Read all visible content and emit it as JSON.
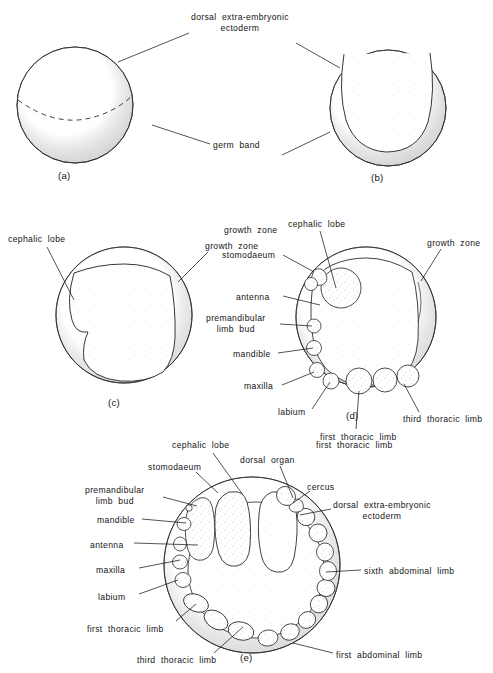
{
  "figure": {
    "panel_count": 5,
    "background_color": "#ffffff",
    "ink_color": "#1a1a1a"
  },
  "panels": [
    {
      "id": "(a)",
      "name": "panel-a",
      "center": [
        75,
        105
      ],
      "radius": 58,
      "labels": [
        {
          "name": "dorsal-extra-embryonic-ectoderm",
          "text_lines": [
            "dorsal  extra-embryonic",
            "ectoderm"
          ],
          "text": "dorsal extra-embryonic ectoderm",
          "x": 191,
          "y": 12,
          "align": "left",
          "leader": [
            [
              189,
              33
            ],
            [
              118,
              62
            ]
          ]
        },
        {
          "name": "germ-band",
          "text_lines": [
            "germ  band"
          ],
          "text": "germ band",
          "x": 213,
          "y": 140,
          "align": "left",
          "leader": [
            [
              210,
              144
            ],
            [
              152,
              125
            ]
          ]
        }
      ]
    },
    {
      "id": "(b)",
      "name": "panel-b",
      "center": [
        388,
        108
      ],
      "radius": 58,
      "labels": [
        {
          "name": "dorsal-extra-embryonic-ectoderm-leader-b",
          "text": "",
          "leader": [
            [
              296,
              43
            ],
            [
              340,
              68
            ]
          ]
        },
        {
          "name": "germ-band-leader-b",
          "text": "",
          "leader": [
            [
              282,
              155
            ],
            [
              330,
              132
            ]
          ]
        }
      ]
    },
    {
      "id": "(c)",
      "name": "panel-c",
      "center": [
        124,
        315
      ],
      "radius": 68,
      "labels": [
        {
          "name": "cephalic-lobe",
          "text_lines": [
            "cephalic  lobe"
          ],
          "text": "cephalic lobe",
          "x": 8,
          "y": 234,
          "align": "left",
          "leader": [
            [
              47,
              247
            ],
            [
              74,
              300
            ]
          ]
        },
        {
          "name": "growth-zone",
          "text_lines": [
            "growth  zone"
          ],
          "text": "growth zone",
          "x": 205,
          "y": 241,
          "align": "left",
          "leader": [
            [
              208,
              252
            ],
            [
              178,
              282
            ]
          ]
        }
      ]
    },
    {
      "id": "(d)",
      "name": "panel-d",
      "center": [
        366,
        317
      ],
      "radius": 70,
      "labels": [
        {
          "name": "cephalic-lobe",
          "text": "cephalic lobe",
          "text_lines": [
            "cephalic  lobe"
          ],
          "x": 288,
          "y": 219,
          "align": "left",
          "leader": [
            [
              320,
              231
            ],
            [
              336,
              288
            ]
          ]
        },
        {
          "name": "growth-zone",
          "text": "growth zone",
          "text_lines": [
            "growth  zone"
          ],
          "x": 427,
          "y": 238,
          "align": "left",
          "leader": [
            [
              441,
              249
            ],
            [
              421,
              281
            ]
          ]
        },
        {
          "name": "growth-zone-left",
          "text": "growth zone",
          "text_lines": [
            "growth  zone"
          ],
          "x": 224,
          "y": 225,
          "align": "left",
          "leader": null
        },
        {
          "name": "stomodaeum",
          "text": "stomodaeum",
          "text_lines": [
            "stomodaeum"
          ],
          "x": 222,
          "y": 250,
          "align": "left",
          "leader": [
            [
              283,
              255
            ],
            [
              314,
              272
            ]
          ]
        },
        {
          "name": "antenna",
          "text": "antenna",
          "text_lines": [
            "antenna"
          ],
          "x": 236,
          "y": 292,
          "align": "left",
          "leader": [
            [
              283,
              296
            ],
            [
              320,
              305
            ]
          ]
        },
        {
          "name": "premandibular-limb-bud",
          "text": "premandibular limb bud",
          "text_lines": [
            "premandibular",
            "limb  bud"
          ],
          "x": 206,
          "y": 313,
          "align": "left",
          "leader": [
            [
              280,
              324
            ],
            [
              312,
              326
            ]
          ]
        },
        {
          "name": "mandible",
          "text": "mandible",
          "text_lines": [
            "mandible"
          ],
          "x": 233,
          "y": 349,
          "align": "left",
          "leader": [
            [
              278,
              353
            ],
            [
              313,
              348
            ]
          ]
        },
        {
          "name": "maxilla",
          "text": "maxilla",
          "text_lines": [
            "maxilla"
          ],
          "x": 244,
          "y": 381,
          "align": "left",
          "leader": [
            [
              282,
              385
            ],
            [
              314,
              372
            ]
          ]
        },
        {
          "name": "labium",
          "text": "labium",
          "text_lines": [
            "labium"
          ],
          "x": 278,
          "y": 407,
          "align": "left",
          "leader": [
            [
              312,
              409
            ],
            [
              330,
              382
            ]
          ]
        },
        {
          "name": "third-thoracic-limb",
          "text": "third thoracic limb",
          "text_lines": [
            "third  thoracic  limb"
          ],
          "x": 403,
          "y": 414,
          "align": "left",
          "leader": [
            [
              419,
              412
            ],
            [
              404,
              384
            ]
          ]
        },
        {
          "name": "first-thoracic-limb",
          "text": "first thoracic limb",
          "text_lines": [
            "first  thoracic  limb"
          ],
          "x": 320,
          "y": 432,
          "align": "left",
          "leader": [
            [
              356,
              429
            ],
            [
              359,
              391
            ]
          ]
        }
      ]
    },
    {
      "id": "(e)",
      "name": "panel-e",
      "center": [
        252,
        565
      ],
      "radius": 88,
      "labels": [
        {
          "name": "cephalic-lobe",
          "text": "cephalic lobe",
          "text_lines": [
            "cephalic  lobe"
          ],
          "x": 172,
          "y": 440,
          "align": "left",
          "leader": [
            [
              213,
              453
            ],
            [
              243,
              495
            ]
          ]
        },
        {
          "name": "stomodaeum",
          "text": "stomodaeum",
          "text_lines": [
            "stomodaeum"
          ],
          "x": 148,
          "y": 462,
          "align": "left",
          "leader": [
            [
              196,
              472
            ],
            [
              218,
              493
            ]
          ]
        },
        {
          "name": "dorsal-organ",
          "text": "dorsal organ",
          "text_lines": [
            "dorsal  organ"
          ],
          "x": 240,
          "y": 455,
          "align": "left",
          "leader": [
            [
              280,
              466
            ],
            [
              293,
              498
            ]
          ]
        },
        {
          "name": "cercus",
          "text": "cercus",
          "text_lines": [
            "cercus"
          ],
          "x": 307,
          "y": 482,
          "align": "left",
          "leader": [
            [
              310,
              491
            ],
            [
              293,
              503
            ]
          ]
        },
        {
          "name": "premandibular-limb-bud",
          "text": "premandibular limb bud",
          "text_lines": [
            "premandibular",
            "limb  bud"
          ],
          "x": 85,
          "y": 485,
          "align": "left",
          "leader": [
            [
              163,
              497
            ],
            [
              197,
              506
            ]
          ]
        },
        {
          "name": "mandible",
          "text": "mandible",
          "text_lines": [
            "mandible"
          ],
          "x": 97,
          "y": 515,
          "align": "left",
          "leader": [
            [
              142,
              519
            ],
            [
              186,
              523
            ]
          ]
        },
        {
          "name": "antenna",
          "text": "antenna",
          "text_lines": [
            "antenna"
          ],
          "x": 90,
          "y": 540,
          "align": "left",
          "leader": [
            [
              134,
              543
            ],
            [
              198,
              545
            ]
          ]
        },
        {
          "name": "maxilla",
          "text": "maxilla",
          "text_lines": [
            "maxilla"
          ],
          "x": 96,
          "y": 565,
          "align": "left",
          "leader": [
            [
              139,
              568
            ],
            [
              180,
              560
            ]
          ]
        },
        {
          "name": "labium",
          "text": "labium",
          "text_lines": [
            "labium"
          ],
          "x": 98,
          "y": 592,
          "align": "left",
          "leader": [
            [
              139,
              594
            ],
            [
              178,
              580
            ]
          ]
        },
        {
          "name": "first-thoracic-limb",
          "text": "first thoracic limb",
          "text_lines": [
            "first  thoracic  limb"
          ],
          "x": 87,
          "y": 624,
          "align": "left",
          "leader": [
            [
              176,
              621
            ],
            [
              196,
              604
            ]
          ]
        },
        {
          "name": "third-thoracic-limb",
          "text": "third thoracic limb",
          "text_lines": [
            "third  thoracic  limb"
          ],
          "x": 137,
          "y": 655,
          "align": "left",
          "leader": [
            [
              214,
              653
            ],
            [
              243,
              627
            ]
          ]
        },
        {
          "name": "first-thoracic-limb-top",
          "text": "first thoracic limb",
          "text_lines": [
            "first  thoracic  limb"
          ],
          "x": 316,
          "y": 440,
          "align": "left",
          "leader": null
        },
        {
          "name": "dorsal-extra-embryonic-ectoderm",
          "text": "dorsal extra-embryonic ectoderm",
          "text_lines": [
            "dorsal  extra-embryonic",
            "ectoderm"
          ],
          "x": 333,
          "y": 500,
          "align": "left",
          "leader": [
            [
              331,
              509
            ],
            [
              300,
              515
            ]
          ]
        },
        {
          "name": "sixth-abdominal-limb",
          "text": "sixth abdominal limb",
          "text_lines": [
            "sixth  abdominal  limb"
          ],
          "x": 364,
          "y": 566,
          "align": "left",
          "leader": [
            [
              361,
              570
            ],
            [
              326,
              572
            ]
          ]
        },
        {
          "name": "first-abdominal-limb",
          "text": "first abdominal limb",
          "text_lines": [
            "first  abdominal  limb"
          ],
          "x": 336,
          "y": 650,
          "align": "left",
          "leader": [
            [
              333,
              653
            ],
            [
              293,
              643
            ]
          ]
        }
      ]
    }
  ],
  "panel_ids": [
    {
      "name": "panel-id-a",
      "text": "(a)",
      "x": 58,
      "y": 170
    },
    {
      "name": "panel-id-b",
      "text": "(b)",
      "x": 371,
      "y": 172
    },
    {
      "name": "panel-id-c",
      "text": "(c)",
      "x": 108,
      "y": 397
    },
    {
      "name": "panel-id-d",
      "text": "(d)",
      "x": 346,
      "y": 410
    },
    {
      "name": "panel-id-e",
      "text": "(e)",
      "x": 240,
      "y": 652
    }
  ]
}
